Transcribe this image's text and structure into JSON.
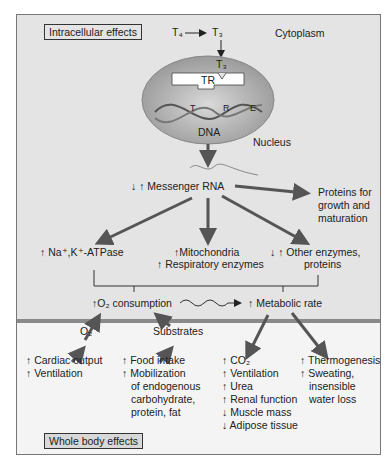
{
  "labels": {
    "intracellular": "Intracellular effects",
    "whole_body": "Whole body effects",
    "t4": "T₄",
    "arrow_t": "T₃",
    "cytoplasm": "Cytoplasm",
    "t3_inner": "T₃",
    "tr": "TR",
    "tre_t": "T",
    "tre_r": "R",
    "tre_e": "E",
    "dna": "DNA",
    "nucleus": "Nucleus",
    "mrna": "↓ ↑ Messenger RNA",
    "proteins": [
      "Proteins for",
      "growth and",
      "maturation"
    ],
    "atpase": "↑ Na⁺,K⁺-ATPase",
    "mito": "↑Mitochondria",
    "resp": "↑ Respiratory enzymes",
    "other1": "↓ ↑ Other enzymes,",
    "other2": "proteins",
    "o2cons": "↑O₂ consumption",
    "metab": "↑ Metabolic rate",
    "o2": "O₂",
    "substrates": "Substrates"
  },
  "columns": {
    "col1": [
      "↑ Cardiac output",
      "↑ Ventilation"
    ],
    "col2": [
      "↑ Food intake",
      "↑ Mobilization",
      "of endogenous",
      "carbohydrate,",
      "protein, fat"
    ],
    "col3": [
      "↑ CO₂",
      "↑ Ventilation",
      "↑ Urea",
      "↑ Renal function",
      "↓ Muscle mass",
      "↓ Adipose tissue"
    ],
    "col4": [
      "↑ Thermogenesis",
      "↑ Sweating,",
      "insensible",
      "water loss"
    ]
  },
  "colors": {
    "top_bg": "#e4e4e4",
    "bottom_bg": "#f4f4f4",
    "arrow": "#555555"
  }
}
